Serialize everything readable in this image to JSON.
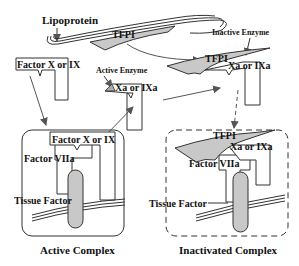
{
  "diagram": {
    "type": "mechanism",
    "labels": {
      "lipoprotein": "Lipoprotein",
      "tfpi_top": "TFPI",
      "inactive_enzyme": "Inactive Enzyme",
      "tfpi_mid": "TFPI",
      "xa_ixa_mid_right": "Xa or IXa",
      "factor_x_ix_top": "Factor X or IX",
      "active_enzyme": "Active Enzyme",
      "xa_ixa_center": "Xa or IXa",
      "factor_x_ix_complex": "Factor X or IX",
      "factor_viia_left": "Factor VIIa",
      "tissue_factor_left": "Tissue Factor",
      "active_complex": "Active Complex",
      "tfpi_bottom": "TFPI",
      "xa_ixa_bottom": "Xa or IXa",
      "factor_viia_right": "Factor VIIa",
      "tissue_factor_right": "Tissue Factor",
      "inactivated_complex": "Inactivated Complex"
    },
    "colors": {
      "line": "#333333",
      "arrow": "#555555",
      "fill_grey": "#c8c8c8",
      "background": "#ffffff"
    }
  }
}
